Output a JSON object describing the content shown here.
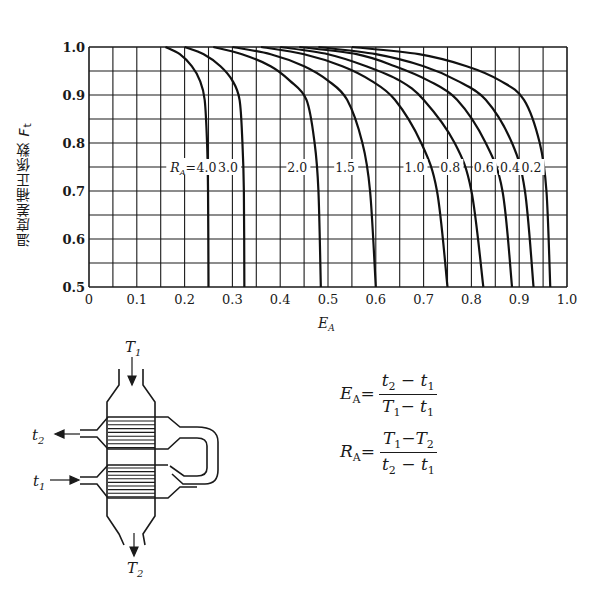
{
  "chart_data": {
    "type": "line",
    "title": "",
    "xlabel": "E_A",
    "ylabel": "温度差補正係数 F_t",
    "xlim": [
      0,
      1.0
    ],
    "ylim": [
      0.5,
      1.0
    ],
    "grid": true,
    "x_ticks": [
      "0",
      "0.1",
      "0.2",
      "0.3",
      "0.4",
      "0.5",
      "0.6",
      "0.7",
      "0.8",
      "0.9",
      "1.0"
    ],
    "y_ticks": [
      "0.5",
      "0.6",
      "0.7",
      "0.8",
      "0.9",
      "1.0"
    ],
    "legend_inline": "R_A = 4.0, 3.0, 2.0, 1.5, 1.0, 0.8, 0.6, 0.4, 0.2",
    "series": [
      {
        "name": "R_A=4.0",
        "points": [
          [
            0.16,
            1.0
          ],
          [
            0.19,
            0.985
          ],
          [
            0.215,
            0.96
          ],
          [
            0.232,
            0.93
          ],
          [
            0.242,
            0.89
          ],
          [
            0.247,
            0.8
          ],
          [
            0.249,
            0.7
          ],
          [
            0.25,
            0.5
          ]
        ]
      },
      {
        "name": "R_A=3.0",
        "points": [
          [
            0.2,
            1.0
          ],
          [
            0.24,
            0.985
          ],
          [
            0.275,
            0.96
          ],
          [
            0.3,
            0.93
          ],
          [
            0.315,
            0.89
          ],
          [
            0.321,
            0.8
          ],
          [
            0.324,
            0.7
          ],
          [
            0.325,
            0.5
          ]
        ]
      },
      {
        "name": "R_A=2.0",
        "points": [
          [
            0.26,
            1.0
          ],
          [
            0.32,
            0.985
          ],
          [
            0.38,
            0.96
          ],
          [
            0.42,
            0.93
          ],
          [
            0.455,
            0.89
          ],
          [
            0.472,
            0.8
          ],
          [
            0.48,
            0.7
          ],
          [
            0.485,
            0.5
          ]
        ]
      },
      {
        "name": "R_A=1.5",
        "points": [
          [
            0.3,
            1.0
          ],
          [
            0.38,
            0.985
          ],
          [
            0.45,
            0.96
          ],
          [
            0.5,
            0.93
          ],
          [
            0.54,
            0.89
          ],
          [
            0.572,
            0.8
          ],
          [
            0.588,
            0.7
          ],
          [
            0.6,
            0.5
          ]
        ]
      },
      {
        "name": "R_A=1.0",
        "points": [
          [
            0.36,
            1.0
          ],
          [
            0.45,
            0.985
          ],
          [
            0.53,
            0.96
          ],
          [
            0.59,
            0.93
          ],
          [
            0.64,
            0.89
          ],
          [
            0.695,
            0.8
          ],
          [
            0.728,
            0.7
          ],
          [
            0.75,
            0.5
          ]
        ]
      },
      {
        "name": "R_A=0.8",
        "points": [
          [
            0.4,
            1.0
          ],
          [
            0.5,
            0.985
          ],
          [
            0.58,
            0.96
          ],
          [
            0.65,
            0.93
          ],
          [
            0.7,
            0.89
          ],
          [
            0.765,
            0.8
          ],
          [
            0.8,
            0.7
          ],
          [
            0.825,
            0.5
          ]
        ]
      },
      {
        "name": "R_A=0.6",
        "points": [
          [
            0.44,
            1.0
          ],
          [
            0.56,
            0.985
          ],
          [
            0.64,
            0.96
          ],
          [
            0.71,
            0.93
          ],
          [
            0.77,
            0.89
          ],
          [
            0.83,
            0.8
          ],
          [
            0.865,
            0.7
          ],
          [
            0.885,
            0.5
          ]
        ]
      },
      {
        "name": "R_A=0.4",
        "points": [
          [
            0.48,
            1.0
          ],
          [
            0.6,
            0.985
          ],
          [
            0.7,
            0.96
          ],
          [
            0.77,
            0.93
          ],
          [
            0.83,
            0.89
          ],
          [
            0.885,
            0.8
          ],
          [
            0.912,
            0.7
          ],
          [
            0.93,
            0.5
          ]
        ]
      },
      {
        "name": "R_A=0.2",
        "points": [
          [
            0.55,
            1.0
          ],
          [
            0.69,
            0.985
          ],
          [
            0.79,
            0.96
          ],
          [
            0.86,
            0.93
          ],
          [
            0.91,
            0.89
          ],
          [
            0.943,
            0.8
          ],
          [
            0.957,
            0.7
          ],
          [
            0.965,
            0.5
          ]
        ]
      }
    ],
    "label_row_y": 0.75,
    "label_positions_x": {
      "R_A=": 0.17,
      "4.0": 0.225,
      "3.0": 0.27,
      "2.0": 0.415,
      "1.5": 0.515,
      "1.0": 0.66,
      "0.8": 0.735,
      "0.6": 0.805,
      "0.4": 0.86,
      "0.2": 0.905
    }
  },
  "labels": {
    "prefix": "R",
    "prefix_sub": "A",
    "equals": "=",
    "values": [
      "4.0",
      "3.0",
      "2.0",
      "1.5",
      "1.0",
      "0.8",
      "0.6",
      "0.4",
      "0.2"
    ],
    "x_axis": "E",
    "x_axis_sub": "A",
    "y_axis_text": "温度差補正係数",
    "y_axis_symbol": "F",
    "y_axis_sub": "t"
  },
  "diagram": {
    "T1": "T",
    "T1_sub": "1",
    "T2": "T",
    "T2_sub": "2",
    "t1": "t",
    "t1_sub": "1",
    "t2": "t",
    "t2_sub": "2"
  },
  "formulas": {
    "EA": {
      "lhs": "E",
      "lhs_sub": "A",
      "num_a": "t",
      "num_a_sub": "2",
      "num_op": " − ",
      "num_b": "t",
      "num_b_sub": "1",
      "den_a": "T",
      "den_a_sub": "1",
      "den_op": "− ",
      "den_b": "t",
      "den_b_sub": "1"
    },
    "RA": {
      "lhs": "R",
      "lhs_sub": "A",
      "num_a": "T",
      "num_a_sub": "1",
      "num_op": "−",
      "num_b": "T",
      "num_b_sub": "2",
      "den_a": "t",
      "den_a_sub": "2",
      "den_op": " − ",
      "den_b": "t",
      "den_b_sub": "1"
    }
  }
}
